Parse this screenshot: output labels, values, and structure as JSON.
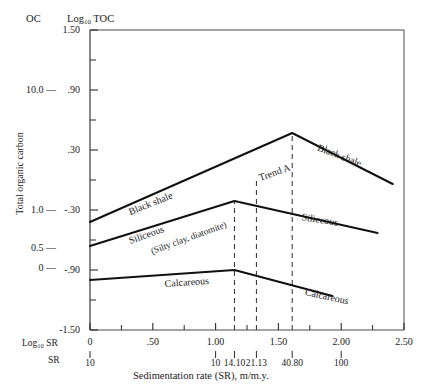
{
  "header": {
    "oc_label": "OC",
    "toc_label": "Log",
    "toc_sub": "10",
    "toc_label_tail": " TOC"
  },
  "axes": {
    "ylabel": "Total organic carbon",
    "xlabel": "Sedimentation rate (SR), m/m.y.",
    "x_axis_name_log": "Log",
    "x_axis_name_log_sub": "10",
    "x_axis_name_log_tail": " SR",
    "x_axis_name_sr": "SR",
    "y_toc_ticks": [
      "1.50",
      ".90",
      ".30",
      "-.30",
      "-.90",
      "-1.50"
    ],
    "y_toc_tick_values": [
      1.5,
      0.9,
      0.3,
      -0.3,
      -0.9,
      -1.5
    ],
    "y_toc_minor_values": [
      1.2,
      0.6,
      0.0,
      -0.6,
      -1.2
    ],
    "y_oc_ticks": [
      "10.0",
      "1.0",
      "0.5",
      "0"
    ],
    "y_oc_tick_values": [
      0.9,
      -0.3,
      -0.68,
      -0.88
    ],
    "x_ticks": [
      "0",
      ".50",
      "1.00",
      "1.50",
      "2.00",
      "2.50"
    ],
    "x_tick_values": [
      0.0,
      0.5,
      1.0,
      1.5,
      2.0,
      2.5
    ],
    "x_minor_values": [
      0.25,
      0.75,
      1.25,
      1.75,
      2.25
    ],
    "sr_ticks": [
      "10",
      "10",
      "14.10",
      "21.13",
      "40.80",
      "100"
    ],
    "sr_tick_values": [
      0.0,
      1.0,
      1.15,
      1.325,
      1.61,
      2.0
    ]
  },
  "chart_data": {
    "type": "line",
    "title": "",
    "xlabel": "Sedimentation rate (SR), m/m.y.",
    "ylabel": "Total organic carbon",
    "xlim": [
      0.0,
      2.5
    ],
    "ylim": [
      -1.5,
      1.5
    ],
    "grid": false,
    "legend": "inline-annotations",
    "series": [
      {
        "name": "Black shale",
        "x": [
          0.0,
          1.61,
          2.41
        ],
        "y": [
          -0.42,
          0.47,
          -0.04
        ]
      },
      {
        "name": "Siliceous (Silty clay, diatomite)",
        "x": [
          0.0,
          1.15,
          2.29
        ],
        "y": [
          -0.66,
          -0.21,
          -0.53
        ]
      },
      {
        "name": "Calcareous",
        "x": [
          0.0,
          1.15,
          1.93
        ],
        "y": [
          -1.0,
          -0.9,
          -1.16
        ]
      }
    ],
    "reference_lines": [
      {
        "name": "dashed-14.10",
        "x": 1.15
      },
      {
        "name": "dashed-21.13",
        "x": 1.325
      },
      {
        "name": "dashed-40.80",
        "x": 1.61
      }
    ],
    "annotations": [
      {
        "label": "Black shale",
        "x": 0.33,
        "y": -0.27,
        "rotation": -22
      },
      {
        "label": "Black shale",
        "x": 1.8,
        "y": 0.38,
        "rotation": 21
      },
      {
        "label": "Siliceous",
        "x": 0.33,
        "y": -0.56,
        "rotation": -20
      },
      {
        "label": "(Silty clay, diatomite)",
        "x": 0.5,
        "y": -0.67,
        "rotation": -20
      },
      {
        "label": "Siliceous",
        "x": 1.68,
        "y": -0.32,
        "rotation": 9
      },
      {
        "label": "Trend A",
        "x": 1.36,
        "y": 0.07,
        "rotation": -20
      },
      {
        "label": "Calcareous",
        "x": 0.6,
        "y": -0.99,
        "rotation": -4
      },
      {
        "label": "Calcareous",
        "x": 1.7,
        "y": -1.07,
        "rotation": 12
      }
    ]
  },
  "colors": {
    "ink": "#1a1a1a",
    "axis": "#3a3a3a",
    "curve": "#111111",
    "background": "#ffffff"
  }
}
